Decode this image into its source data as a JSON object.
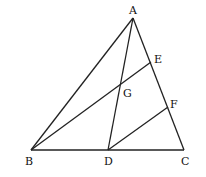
{
  "diagram": {
    "type": "geometry-triangle",
    "points": {
      "A": {
        "label": "A",
        "x": 133,
        "y": 18
      },
      "B": {
        "label": "B",
        "x": 31,
        "y": 150
      },
      "C": {
        "label": "C",
        "x": 184,
        "y": 150
      },
      "D": {
        "label": "D",
        "x": 108,
        "y": 150
      },
      "E": {
        "label": "E",
        "x": 151,
        "y": 62
      },
      "F": {
        "label": "F",
        "x": 168,
        "y": 107
      },
      "G": {
        "label": "G",
        "x": 121,
        "y": 85
      }
    },
    "segments": [
      "AB",
      "AC",
      "BC",
      "AD",
      "BE",
      "DF"
    ],
    "labels": {
      "A": "A",
      "B": "B",
      "C": "C",
      "D": "D",
      "E": "E",
      "F": "F",
      "G": "G"
    }
  }
}
